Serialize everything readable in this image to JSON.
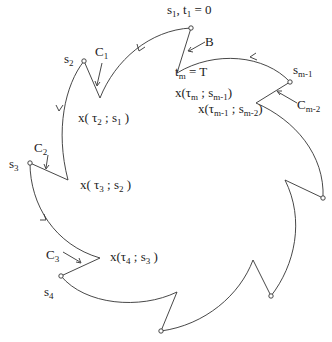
{
  "diagram": {
    "type": "closed-piecewise-trajectory",
    "colors": {
      "stroke": "#333333",
      "background": "#ffffff",
      "text": "#222222"
    },
    "labels": {
      "s1_t1": {
        "base": "s",
        "sub": "1",
        "mid": ", t",
        "sub2": "1",
        "tail": " =  0"
      },
      "B": "B",
      "tm_T": {
        "base": "t",
        "sub": "m",
        "tail": " =  T"
      },
      "x_tm": {
        "pre": "x(τ",
        "sub1": "m",
        "mid": " ; s",
        "sub2": "m-1",
        "post": ")"
      },
      "x_tm1": {
        "pre": "x(τ",
        "sub1": "m-1",
        "mid": " ; s",
        "sub2": "m-2",
        "post": ")"
      },
      "s_m1": {
        "base": "s",
        "sub": "m-1"
      },
      "C_m2": {
        "base": "C",
        "sub": "m-2"
      },
      "s2": {
        "base": "s",
        "sub": "2"
      },
      "C1": {
        "base": "C",
        "sub": "1"
      },
      "x_t2": {
        "pre": "x( τ",
        "sub1": "2",
        "mid": " ; s",
        "sub2": "1",
        "post": " )"
      },
      "C2": {
        "base": "C",
        "sub": "2"
      },
      "s3": {
        "base": "s",
        "sub": "3"
      },
      "x_t3": {
        "pre": "x( τ",
        "sub1": "3",
        "mid": " ; s",
        "sub2": "2",
        "post": " )"
      },
      "C3": {
        "base": "C",
        "sub": "3"
      },
      "x_t4": {
        "pre": "x(τ",
        "sub1": "4",
        "mid": " ; s",
        "sub2": "3",
        "post": " )"
      },
      "s4": {
        "base": "s",
        "sub": "4"
      }
    },
    "nodes": [
      {
        "name": "s1",
        "x": 191,
        "y": 28
      },
      {
        "name": "s2",
        "x": 84,
        "y": 61
      },
      {
        "name": "s3",
        "x": 30,
        "y": 163
      },
      {
        "name": "s4",
        "x": 61,
        "y": 276
      },
      {
        "name": "s5",
        "x": 161,
        "y": 331
      },
      {
        "name": "s6",
        "x": 271,
        "y": 296
      },
      {
        "name": "s7",
        "x": 323,
        "y": 198
      },
      {
        "name": "s_m-1",
        "x": 290,
        "y": 82
      }
    ]
  }
}
